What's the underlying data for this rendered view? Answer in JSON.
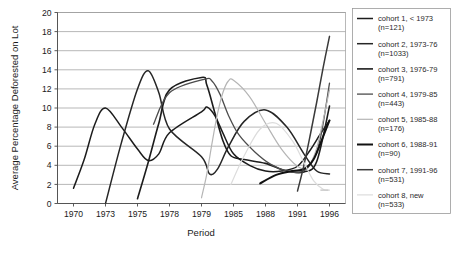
{
  "chart_data": {
    "type": "line",
    "title": "",
    "xlabel": "Period",
    "ylabel": "Average Percentage Deforested on Lot",
    "xtick_labels": [
      "1970",
      "1973",
      "1975",
      "1978",
      "1979",
      "1985",
      "1988",
      "1991",
      "1996"
    ],
    "ytick_labels": [
      "0",
      "2",
      "4",
      "6",
      "8",
      "10",
      "12",
      "14",
      "16",
      "18",
      "20"
    ],
    "ylim": [
      0,
      20
    ],
    "ytick_step": 2,
    "grid": "horizontal",
    "legend_position": "right",
    "categories": [
      "1970",
      "1973",
      "1975",
      "1978",
      "1979",
      "1985",
      "1988",
      "1991",
      "1996"
    ],
    "series": [
      {
        "name": "cohort 1, < 1973",
        "n": 121,
        "label_line1": "cohort 1, < 1973",
        "label_line2": "(n=121)",
        "color": "#1c1c1c",
        "width": 1.5,
        "x": [
          1970,
          1971,
          1972,
          1973,
          1974,
          1975,
          1976,
          1977,
          1978,
          1979,
          1980,
          1981.5,
          1983,
          1985,
          1986.5,
          1988,
          1989.5,
          1991,
          1993,
          1994.5,
          1996
        ],
        "values": [
          1.6,
          4.6,
          8.3,
          10.0,
          8.0,
          5.7,
          4.5,
          5.2,
          7.4,
          9.6,
          10.1,
          9.2,
          7.4,
          5.2,
          4.0,
          3.4,
          3.4,
          3.9,
          5.6,
          7.2,
          8.7
        ]
      },
      {
        "name": "cohort 2, 1973-76",
        "n": 1033,
        "label_line1": "cohort 2, 1973-76",
        "label_line2": "(n=1033)",
        "color": "#262626",
        "width": 1.5,
        "x": [
          1973,
          1974,
          1975,
          1976,
          1977,
          1978,
          1979,
          1980.5,
          1982,
          1984,
          1986,
          1988,
          1990,
          1992,
          1994,
          1996
        ],
        "values": [
          0.0,
          6.4,
          12.0,
          13.9,
          11.6,
          7.8,
          4.9,
          3.1,
          3.6,
          5.9,
          8.6,
          9.8,
          8.0,
          5.2,
          3.4,
          3.1
        ]
      },
      {
        "name": "cohort 3, 1976-79",
        "n": 791,
        "label_line1": "cohort 3, 1976-79",
        "label_line2": "(n=791)",
        "color": "#1c1c1c",
        "width": 1.6,
        "x": [
          1975,
          1976,
          1977,
          1978,
          1979,
          1980,
          1981.5,
          1983,
          1984.5,
          1986,
          1988,
          1990,
          1992,
          1994,
          1996
        ],
        "values": [
          0.5,
          4.3,
          8.4,
          11.9,
          13.2,
          12.4,
          9.5,
          6.6,
          5.0,
          4.6,
          4.2,
          3.4,
          3.3,
          4.4,
          10.2
        ]
      },
      {
        "name": "cohort 4, 1979-85",
        "n": 443,
        "label_line1": "cohort 4, 1979-85",
        "label_line2": "(n=443)",
        "color": "#4d4d4d",
        "width": 1.3,
        "x": [
          1976.5,
          1978,
          1979.5,
          1981,
          1982.5,
          1984,
          1985.5,
          1987,
          1988.5,
          1990,
          1991.5,
          1993,
          1994.5,
          1996
        ],
        "values": [
          8.3,
          11.6,
          13.0,
          12.8,
          11.4,
          9.3,
          7.2,
          5.4,
          4.1,
          3.4,
          3.3,
          4.1,
          6.6,
          12.6
        ]
      },
      {
        "name": "cohort 5, 1985-88",
        "n": 176,
        "label_line1": "cohort 5, 1985-88",
        "label_line2": "(n=176)",
        "color": "#b5b5b5",
        "width": 1.2,
        "x": [
          1979,
          1980,
          1981,
          1982,
          1983,
          1984,
          1985,
          1986.5,
          1988,
          1989.5,
          1991,
          1992.5,
          1994,
          1996
        ],
        "values": [
          0.6,
          3.1,
          6.4,
          9.4,
          11.6,
          12.8,
          12.9,
          11.2,
          8.4,
          5.7,
          3.9,
          3.8,
          5.8,
          11.9
        ]
      },
      {
        "name": "cohort 6, 1988-91",
        "n": 90,
        "label_line1": "cohort 6, 1988-91",
        "label_line2": "(n=90)",
        "color": "#111111",
        "width": 2.0,
        "x": [
          1987.5,
          1989,
          1990.5,
          1992,
          1993.5,
          1995,
          1996
        ],
        "values": [
          2.1,
          3.0,
          3.4,
          3.6,
          4.6,
          7.0,
          8.7
        ]
      },
      {
        "name": "cohort 7, 1991-96",
        "n": 531,
        "label_line1": "cohort 7, 1991-96",
        "label_line2": "(n=531)",
        "color": "#3a3a3a",
        "width": 1.5,
        "x": [
          1991,
          1992,
          1993,
          1994,
          1995,
          1996
        ],
        "values": [
          1.3,
          4.0,
          7.2,
          10.6,
          14.2,
          17.5
        ]
      },
      {
        "name": "cohort 8, new",
        "n": 533,
        "label_line1": "cohort 8, new",
        "label_line2": "(n=533)",
        "color": "#dcdcdc",
        "width": 1.2,
        "x": [
          1984.5,
          1986,
          1987.5,
          1989,
          1990.5,
          1992,
          1993.5,
          1995,
          1996
        ],
        "values": [
          2.0,
          5.0,
          7.8,
          8.4,
          6.6,
          4.3,
          2.4,
          1.5,
          1.4
        ]
      }
    ],
    "marker_annotation": {
      "name": "faint-dash-marker",
      "x": 1995.2,
      "y": 1.4,
      "color": "#c8c8c8"
    }
  }
}
